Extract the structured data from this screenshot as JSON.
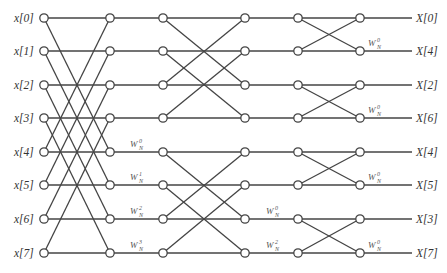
{
  "diagram": {
    "type": "radix-2 decimation-in-frequency 8-point FFT butterfly",
    "inputs": [
      "x[0]",
      "x[1]",
      "x[2]",
      "x[3]",
      "x[4]",
      "x[5]",
      "x[6]",
      "x[7]"
    ],
    "outputs": [
      "X[0]",
      "X[4]",
      "X[2]",
      "X[6]",
      "X[4]",
      "X[5]",
      "X[3]",
      "X[7]"
    ],
    "twiddles": {
      "stage1": [
        {
          "row": 4,
          "base": "W",
          "sub": "N",
          "sup": "0"
        },
        {
          "row": 5,
          "base": "W",
          "sub": "N",
          "sup": "1"
        },
        {
          "row": 6,
          "base": "W",
          "sub": "N",
          "sup": "2"
        },
        {
          "row": 7,
          "base": "W",
          "sub": "N",
          "sup": "3"
        }
      ],
      "stage2": [
        {
          "row": 6,
          "base": "W",
          "sub": "N",
          "sup": "0"
        },
        {
          "row": 7,
          "base": "W",
          "sub": "N",
          "sup": "2"
        }
      ],
      "stage3": [
        {
          "row": 1,
          "base": "W",
          "sub": "N",
          "sup": "0"
        },
        {
          "row": 3,
          "base": "W",
          "sub": "N",
          "sup": "0"
        },
        {
          "row": 5,
          "base": "W",
          "sub": "N",
          "sup": "0"
        },
        {
          "row": 7,
          "base": "W",
          "sub": "N",
          "sup": "0"
        }
      ]
    },
    "colors": {
      "line": "#444444",
      "node_fill": "#ffffff",
      "text": "#333333"
    }
  }
}
